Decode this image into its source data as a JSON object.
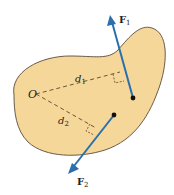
{
  "diagram": {
    "point_label": "O",
    "distances": [
      {
        "symbol": "d",
        "subscript": "1"
      },
      {
        "symbol": "d",
        "subscript": "2"
      }
    ],
    "forces": [
      {
        "symbol": "F",
        "subscript": "1"
      },
      {
        "symbol": "F",
        "subscript": "2"
      }
    ],
    "colors": {
      "body_fill": "#f6d79a",
      "body_stroke": "#5a4a3a",
      "force_arrow": "#2b6fad",
      "dashed_line": "#6b5536",
      "dot": "#111111"
    }
  }
}
